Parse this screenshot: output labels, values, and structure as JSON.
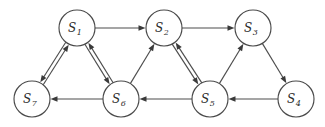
{
  "figure": {
    "type": "directed-graph",
    "width": 325,
    "height": 127,
    "background_color": "#ffffff",
    "node_fill_color": "#ffffff",
    "node_stroke_color": "#4a4a4a",
    "edge_color": "#4d4d4d",
    "arrow_color": "#3a3a3a",
    "node_radius": 18
  },
  "nodes": [
    {
      "id": "S1",
      "label": "S",
      "subscript": "1",
      "cx": 77,
      "cy": 28
    },
    {
      "id": "S2",
      "label": "S",
      "subscript": "2",
      "cx": 164,
      "cy": 28
    },
    {
      "id": "S3",
      "label": "S",
      "subscript": "3",
      "cx": 253,
      "cy": 28
    },
    {
      "id": "S4",
      "label": "S",
      "subscript": "4",
      "cx": 296,
      "cy": 99
    },
    {
      "id": "S5",
      "label": "S",
      "subscript": "5",
      "cx": 210,
      "cy": 99
    },
    {
      "id": "S6",
      "label": "S",
      "subscript": "6",
      "cx": 121,
      "cy": 99
    },
    {
      "id": "S7",
      "label": "S",
      "subscript": "7",
      "cx": 32,
      "cy": 99
    }
  ],
  "edges": [
    {
      "from": "S1",
      "to": "S2",
      "style": "single"
    },
    {
      "from": "S2",
      "to": "S3",
      "style": "single"
    },
    {
      "from": "S1",
      "to": "S7",
      "style": "bidirectional"
    },
    {
      "from": "S1",
      "to": "S6",
      "style": "bidirectional"
    },
    {
      "from": "S2",
      "to": "S5",
      "style": "bidirectional"
    },
    {
      "from": "S6",
      "to": "S2",
      "style": "single"
    },
    {
      "from": "S5",
      "to": "S3",
      "style": "single"
    },
    {
      "from": "S3",
      "to": "S4",
      "style": "single"
    },
    {
      "from": "S4",
      "to": "S5",
      "style": "single"
    },
    {
      "from": "S5",
      "to": "S6",
      "style": "single"
    },
    {
      "from": "S6",
      "to": "S7",
      "style": "single"
    }
  ]
}
